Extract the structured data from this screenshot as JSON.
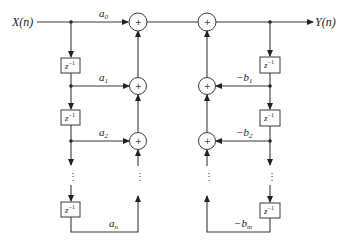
{
  "diagram": {
    "type": "block-diagram",
    "input_label": "X(n)",
    "output_label": "Y(n)",
    "delay_label": {
      "base": "z",
      "exp": "−1"
    },
    "adder_symbol": "+",
    "ellipsis": "⋮",
    "feedforward": {
      "coefficients": [
        {
          "base": "a",
          "sub": "0"
        },
        {
          "base": "a",
          "sub": "1"
        },
        {
          "base": "a",
          "sub": "2"
        },
        {
          "base": "a",
          "sub": "n"
        }
      ]
    },
    "feedback": {
      "coefficients": [
        {
          "base": "−b",
          "sub": "1"
        },
        {
          "base": "−b",
          "sub": "2"
        },
        {
          "base": "−b",
          "sub": "m"
        }
      ]
    },
    "colors": {
      "line": "#3a3a3a",
      "text": "#222222",
      "background": "#ffffff"
    }
  }
}
